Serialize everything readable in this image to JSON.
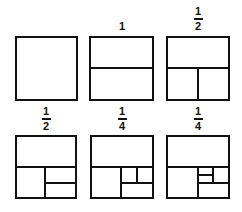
{
  "diagram": {
    "stroke_color": "#111111",
    "background": "#ffffff",
    "panels": [
      {
        "id": "panel-1",
        "label": null,
        "box": [
          16,
          37,
          77,
          100
        ],
        "lines": []
      },
      {
        "id": "panel-2",
        "label": {
          "whole": "1"
        },
        "box": [
          90,
          37,
          153,
          100
        ],
        "lines": [
          [
            90,
            68,
            153,
            68
          ]
        ]
      },
      {
        "id": "panel-3",
        "label": {
          "num": "1",
          "den": "2"
        },
        "box": [
          167,
          37,
          229,
          100
        ],
        "lines": [
          [
            167,
            68,
            229,
            68
          ],
          [
            198,
            68,
            198,
            100
          ]
        ]
      },
      {
        "id": "panel-4",
        "label": {
          "num": "1",
          "den": "2"
        },
        "box": [
          16,
          136,
          76,
          198
        ],
        "lines": [
          [
            16,
            167,
            76,
            167
          ],
          [
            45,
            167,
            45,
            198
          ],
          [
            45,
            183,
            76,
            183
          ]
        ]
      },
      {
        "id": "panel-5",
        "label": {
          "num": "1",
          "den": "4"
        },
        "box": [
          91,
          136,
          153,
          198
        ],
        "lines": [
          [
            91,
            167,
            153,
            167
          ],
          [
            121,
            167,
            121,
            198
          ],
          [
            121,
            183,
            153,
            183
          ],
          [
            137,
            167,
            137,
            183
          ]
        ]
      },
      {
        "id": "panel-6",
        "label": {
          "num": "1",
          "den": "4"
        },
        "box": [
          167,
          136,
          229,
          198
        ],
        "lines": [
          [
            167,
            167,
            229,
            167
          ],
          [
            198,
            167,
            198,
            198
          ],
          [
            198,
            183,
            229,
            183
          ],
          [
            213,
            167,
            213,
            183
          ],
          [
            198,
            175,
            213,
            175
          ]
        ]
      }
    ]
  },
  "labels": {
    "panel2": "1",
    "panel3_num": "1",
    "panel3_den": "2",
    "panel4_num": "1",
    "panel4_den": "2",
    "panel5_num": "1",
    "panel5_den": "4",
    "panel6_num": "1",
    "panel6_den": "4"
  }
}
